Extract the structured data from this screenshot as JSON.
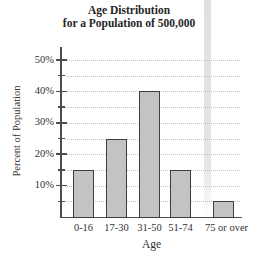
{
  "chart_data": {
    "type": "bar",
    "title": "Age Distribution",
    "subtitle": "for a Population of 500,000",
    "categories": [
      "0-16",
      "17-30",
      "31-50",
      "51-74",
      "75 or over"
    ],
    "values": [
      15,
      25,
      40,
      15,
      5
    ],
    "xlabel": "Age",
    "ylabel": "Percent of Population",
    "ylim": [
      0,
      55
    ],
    "ytick_values": [
      10,
      20,
      30,
      40,
      50
    ],
    "ytick_labels": [
      "10%",
      "20%",
      "30%",
      "40%",
      "50%"
    ],
    "minor_ytick_values": [
      5,
      15,
      25,
      35,
      45
    ],
    "grid": "dotted horizontal line every 5%",
    "legend": "none",
    "colors": {
      "bar_fill": "#c3c3c3",
      "bar_border": "#3e3e3e",
      "grid_line": "#c9c1b5",
      "axis": "#4d4d4d",
      "text": "#2e2e2e",
      "scan_artifact_band": "#c6c6c6",
      "background": "#ffffff"
    }
  }
}
